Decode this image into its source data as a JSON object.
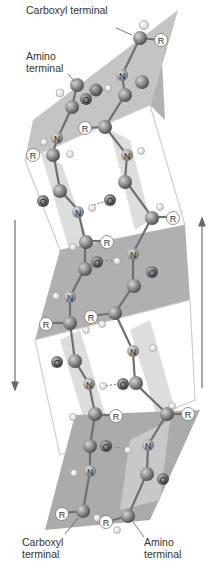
{
  "figure": {
    "labels": {
      "top_carboxyl": "Carboxyl terminal",
      "top_amino_line1": "Amino",
      "top_amino_line2": "terminal",
      "bottom_carboxyl_line1": "Carboxyl",
      "bottom_carboxyl_line2": "terminal",
      "bottom_amino_line1": "Amino",
      "bottom_amino_line2": "terminal"
    },
    "atom_symbols": {
      "nitrogen": "N",
      "oxygen": "O",
      "side_chain": "R"
    },
    "arrows": [
      {
        "name": "left-strand-direction",
        "direction": "down"
      },
      {
        "name": "right-strand-direction",
        "direction": "up"
      }
    ],
    "colors": {
      "sheet_dark": "#a9a9a9",
      "sheet_light": "#cfcfcf",
      "carbon": "#7a7a7a",
      "hydrogen": "#f2f2f2",
      "side_chain_fill": "#ffffff",
      "bond": "#777777",
      "arrow": "#666666"
    }
  }
}
